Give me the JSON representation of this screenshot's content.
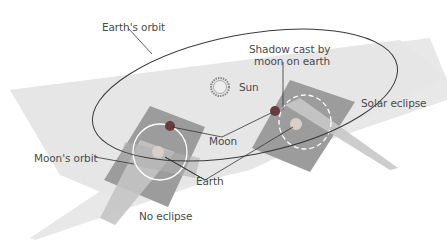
{
  "diagram": {
    "labels": {
      "earths_orbit": "Earth's orbit",
      "shadow": [
        "Shadow cast by",
        "moon on earth"
      ],
      "sun": "Sun",
      "solar_eclipse": "Solar eclipse",
      "moons_orbit": "Moon's orbit",
      "moon": "Moon",
      "earth": "Earth",
      "no_eclipse": "No eclipse"
    },
    "colors": {
      "plane": "#e6e6e6",
      "moon_plane": "#9a9a9a",
      "moon": "#6b3b3b",
      "orbit_line": "#3a3a3a",
      "shadow_beam": "#c8c8c8",
      "text": "#4a4a4a"
    }
  }
}
